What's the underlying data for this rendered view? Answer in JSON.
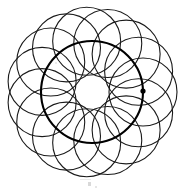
{
  "figure": {
    "title": "Rosette of overlapping circles",
    "kind": "geometric-line-drawing",
    "background_color": "#ffffff",
    "stroke_color": "#1a1a1a",
    "accent_color": "#000000",
    "canvas": {
      "width": 185,
      "height": 193
    },
    "center": {
      "x": 92,
      "y": 92
    },
    "petal_circles": {
      "count": 15,
      "radius": 34,
      "locus_radius": 51,
      "stroke_width": 1.1,
      "start_angle_deg": 0
    },
    "locus_circle": {
      "label": "bold-locus-circle",
      "radius": 51,
      "stroke_width": 2.1
    },
    "center_void": {
      "label": "inner-white-polygon",
      "approx_radius": 17
    },
    "marker_dot": {
      "label": "center-marker",
      "x": 143,
      "y": 91,
      "radius": 2.6
    },
    "artifacts": [
      {
        "name": "scan-speck-lower-center"
      },
      {
        "name": "scan-speck-lower-right"
      },
      {
        "name": "scan-smudge-bottom"
      },
      {
        "name": "scan-speck-upper-left"
      }
    ]
  },
  "chart_data": {
    "type": "scatter",
    "title": "Rosette of overlapping circles",
    "xlabel": "",
    "ylabel": "",
    "xlim": [
      0,
      185
    ],
    "ylim": [
      0,
      193
    ],
    "grid": false,
    "legend": "none",
    "annotations": [
      "15 congruent circles, radius 34 px",
      "centers spaced 24 deg apart on a circle of radius 51 px",
      "bold locus circle drawn through all centers",
      "filled marker dot at one center (143, 91)"
    ],
    "series": [
      {
        "name": "circle-centers",
        "x": [
          143.0,
          140.2,
          132.1,
          119.5,
          103.8,
          86.7,
          70.1,
          56.0,
          46.0,
          41.4,
          42.7,
          49.6,
          61.5,
          77.0,
          94.4,
          111.7,
          126.6,
          137.2
        ],
        "y": [
          92.0,
          108.9,
          124.4,
          136.9,
          145.2,
          148.4,
          146.4,
          139.4,
          128.2,
          114.3,
          99.5,
          85.4,
          73.4,
          64.8,
          60.2,
          60.0,
          64.3,
          72.5
        ]
      }
    ]
  }
}
